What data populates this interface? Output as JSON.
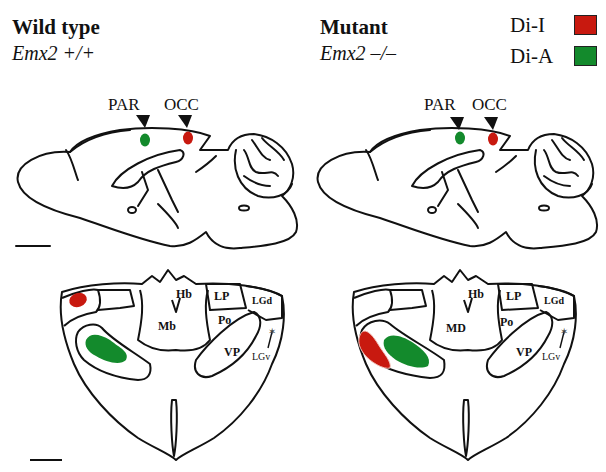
{
  "panels": {
    "left": {
      "title": "Wild type",
      "genotype": "Emx2 +/+",
      "sagittal": {
        "markers": [
          "PAR",
          "OCC"
        ]
      },
      "coronal": {
        "regions": [
          "Hb",
          "LP",
          "LGd",
          "Mb",
          "Po",
          "VP",
          "LGv"
        ]
      }
    },
    "right": {
      "title": "Mutant",
      "genotype": "Emx2 –/–",
      "sagittal": {
        "markers": [
          "PAR",
          "OCC"
        ]
      },
      "coronal": {
        "regions": [
          "Hb",
          "LP",
          "LGd",
          "MD",
          "Po",
          "VP",
          "LGv"
        ]
      }
    }
  },
  "legend": {
    "items": [
      {
        "label": "Di-I",
        "color": "#c8190f"
      },
      {
        "label": "Di-A",
        "color": "#138a2c"
      }
    ]
  },
  "colors": {
    "dii": "#c8190f",
    "dia": "#138a2c",
    "line": "#111111"
  }
}
